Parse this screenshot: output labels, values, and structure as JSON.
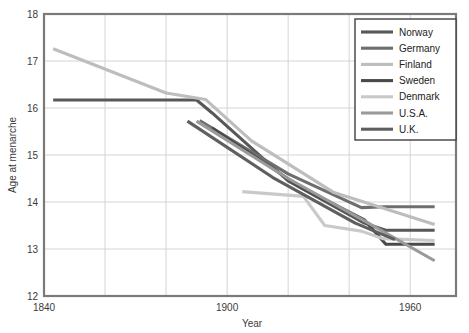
{
  "chart_data": {
    "type": "line",
    "title": "",
    "xlabel": "Year",
    "ylabel": "Age at menarche",
    "xlim": [
      1840,
      1975
    ],
    "ylim": [
      12,
      18
    ],
    "xticks": [
      1840,
      1900,
      1960
    ],
    "xtick_labels": [
      "1840",
      "1900",
      "1960"
    ],
    "yticks": [
      12,
      13,
      14,
      15,
      16,
      17,
      18
    ],
    "ytick_labels": [
      "12",
      "13",
      "14",
      "15",
      "16",
      "17",
      "18"
    ],
    "grid": true,
    "grid_x_minor_years": [
      1860,
      1880,
      1900,
      1920,
      1940,
      1960
    ],
    "legend_position": "top-right",
    "series": [
      {
        "name": "Norway",
        "color": "#585858",
        "points": [
          [
            1843,
            16.17
          ],
          [
            1890,
            16.17
          ],
          [
            1895,
            15.9
          ],
          [
            1920,
            14.45
          ],
          [
            1945,
            13.55
          ],
          [
            1952,
            13.4
          ],
          [
            1968,
            13.4
          ]
        ]
      },
      {
        "name": "Germany",
        "color": "#6e6e6e",
        "points": [
          [
            1891,
            15.73
          ],
          [
            1920,
            14.6
          ],
          [
            1944,
            13.88
          ],
          [
            1952,
            13.9
          ],
          [
            1968,
            13.9
          ]
        ]
      },
      {
        "name": "Finland",
        "color": "#bdbdbd",
        "points": [
          [
            1843,
            17.26
          ],
          [
            1880,
            16.32
          ],
          [
            1893,
            16.18
          ],
          [
            1908,
            15.3
          ],
          [
            1935,
            14.2
          ],
          [
            1968,
            13.52
          ]
        ]
      },
      {
        "name": "Sweden",
        "color": "#4a4a4a",
        "points": [
          [
            1895,
            15.58
          ],
          [
            1924,
            14.32
          ],
          [
            1945,
            13.62
          ],
          [
            1952,
            13.1
          ],
          [
            1968,
            13.1
          ]
        ]
      },
      {
        "name": "Denmark",
        "color": "#c9c9c9",
        "points": [
          [
            1905,
            14.22
          ],
          [
            1925,
            14.12
          ],
          [
            1932,
            13.5
          ],
          [
            1944,
            13.38
          ],
          [
            1951,
            13.22
          ],
          [
            1968,
            13.18
          ]
        ]
      },
      {
        "name": "U.S.A.",
        "color": "#9a9a9a",
        "points": [
          [
            1890,
            15.72
          ],
          [
            1920,
            14.5
          ],
          [
            1945,
            13.6
          ],
          [
            1968,
            12.75
          ]
        ]
      },
      {
        "name": "U.K.",
        "color": "#5f5f5f",
        "points": [
          [
            1887,
            15.72
          ],
          [
            1915,
            14.52
          ],
          [
            1942,
            13.55
          ],
          [
            1955,
            13.2
          ]
        ]
      }
    ]
  }
}
